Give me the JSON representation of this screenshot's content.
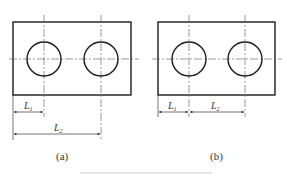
{
  "figures": [
    {
      "id": "a",
      "caption": "(a)",
      "dim_labels": {
        "first": "L",
        "first_sub": "1",
        "second": "L",
        "second_sub": "2"
      },
      "dimensioning": "baseline (both from left edge)"
    },
    {
      "id": "b",
      "caption": "(b)",
      "dim_labels": {
        "first": "L",
        "first_sub": "1",
        "second": "L",
        "second_sub": "2"
      },
      "dimensioning": "chain (L2 continues from end of L1)"
    }
  ],
  "colors": {
    "line": "#1a1a1a",
    "centerline": "#555555",
    "rule": "#e6e6e6"
  }
}
